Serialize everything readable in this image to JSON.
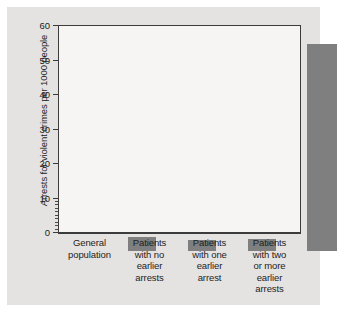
{
  "chart_data": {
    "type": "bar",
    "title": "",
    "subtitle": "",
    "xlabel": "",
    "ylabel": "Arrests for violent crimes per 1000 people",
    "ylim": [
      0,
      60
    ],
    "yticks": [
      0,
      10,
      20,
      30,
      40,
      50,
      60
    ],
    "ytick_labels": [
      "0",
      "10",
      "20",
      "30",
      "40",
      "50",
      "60"
    ],
    "minor_ticks": [
      1,
      2,
      3,
      4,
      5,
      6,
      7,
      8,
      9
    ],
    "grid": false,
    "legend": null,
    "categories": [
      "General population",
      "Patients with no earlier arrests",
      "Patients with one earlier arrest",
      "Patients with two or more earlier arrests"
    ],
    "category_lines": [
      [
        "General",
        "population"
      ],
      [
        "Patients",
        "with no",
        "earlier",
        "arrests"
      ],
      [
        "Patients",
        "with one",
        "earlier",
        "arrest"
      ],
      [
        "Patients",
        "with two",
        "or more",
        "earlier",
        "arrests"
      ]
    ],
    "values": [
      4,
      3.3,
      3.5,
      60
    ],
    "bar_color": "#7f7f7f",
    "plot_background": "#f6f5f3",
    "figure_background": "#e4e3e1",
    "axis_color": "#3c3c3c"
  }
}
